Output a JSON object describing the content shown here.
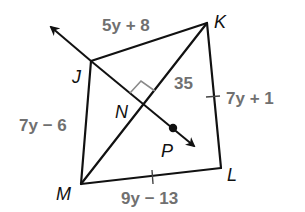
{
  "diagram": {
    "type": "quadrilateral-with-diagonal-and-perpendicular-ray",
    "colors": {
      "line": "#111111",
      "label": "#707070",
      "right_angle_mark": "#8a8a8a"
    },
    "vertices": {
      "J": {
        "label": "J",
        "x": 91,
        "y": 61
      },
      "K": {
        "label": "K",
        "x": 207,
        "y": 23
      },
      "L": {
        "label": "L",
        "x": 221,
        "y": 168
      },
      "M": {
        "label": "M",
        "x": 81,
        "y": 184
      },
      "N": {
        "label": "N",
        "x": 144,
        "y": 105
      },
      "P": {
        "label": "P",
        "x": 173,
        "y": 128
      }
    },
    "side_labels": {
      "JK": "5y + 8",
      "KL": "7y + 1",
      "JM": "7y − 6",
      "ML": "9y − 13",
      "NK": "35"
    },
    "marks": {
      "right_angle_at": "N",
      "congruent_ticks_on": [
        "KL",
        "ML"
      ]
    },
    "ray": {
      "through": [
        "J",
        "N",
        "P"
      ],
      "bidirectional": true
    }
  }
}
